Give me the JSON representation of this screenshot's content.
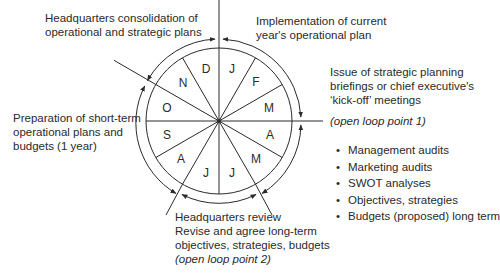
{
  "diagram": {
    "type": "annual planning cycle wheel",
    "months": [
      "J",
      "F",
      "M",
      "A",
      "M",
      "J",
      "J",
      "A",
      "S",
      "O",
      "N",
      "D"
    ],
    "labels": {
      "hq_consolidation": [
        "Headquarters consolidation of",
        "operational and strategic plans"
      ],
      "implementation": [
        "Implementation of current",
        "year's operational plan"
      ],
      "issue_briefings": [
        "Issue of strategic planning",
        "briefings or chief executive's",
        "‘kick-off’ meetings"
      ],
      "open_loop_1": "(open loop point 1)",
      "preparation": [
        "Preparation of short-term",
        "operational plans and",
        "budgets (1 year)"
      ],
      "hq_review": [
        "Headquarters review",
        "Revise and agree long-term",
        "objectives, strategies, budgets"
      ],
      "open_loop_2": "(open loop point 2)"
    },
    "bullets": [
      "Management audits",
      "Marketing audits",
      "SWOT analyses",
      "Objectives, strategies",
      "Budgets (proposed) long term"
    ],
    "colors": {
      "line": "#2a2a2a",
      "background": "#ffffff"
    }
  }
}
